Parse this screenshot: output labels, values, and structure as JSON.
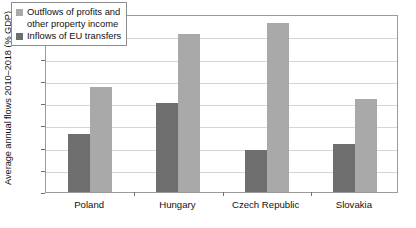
{
  "chart_data": {
    "type": "bar",
    "title": "",
    "xlabel": "",
    "ylabel": "Average annual flows 2010–2018 (% GDP)",
    "ylim": [
      0,
      8
    ],
    "ytick_labels": [
      "0%",
      "1%",
      "2%",
      "3%",
      "4%",
      "5%",
      "6%",
      "7%",
      "8%"
    ],
    "ytick_values": [
      0,
      1,
      2,
      3,
      4,
      5,
      6,
      7,
      8
    ],
    "grid": true,
    "legend_position": "top-left-inside",
    "categories": [
      "Poland",
      "Hungary",
      "Czech Republic",
      "Slovakia"
    ],
    "series": [
      {
        "name": "Inflows of EU transfers",
        "color": "#6e6e6e",
        "values": [
          2.6,
          4.0,
          1.9,
          2.15
        ]
      },
      {
        "name": "Outflows of profits and other property income",
        "color": "#a9a9a9",
        "values": [
          4.7,
          7.1,
          7.6,
          4.2
        ]
      }
    ]
  },
  "legend": {
    "outflows_line1": "Outflows of profits and",
    "outflows_line2": "other property income",
    "inflows_line1": "Inflows of EU transfers"
  }
}
